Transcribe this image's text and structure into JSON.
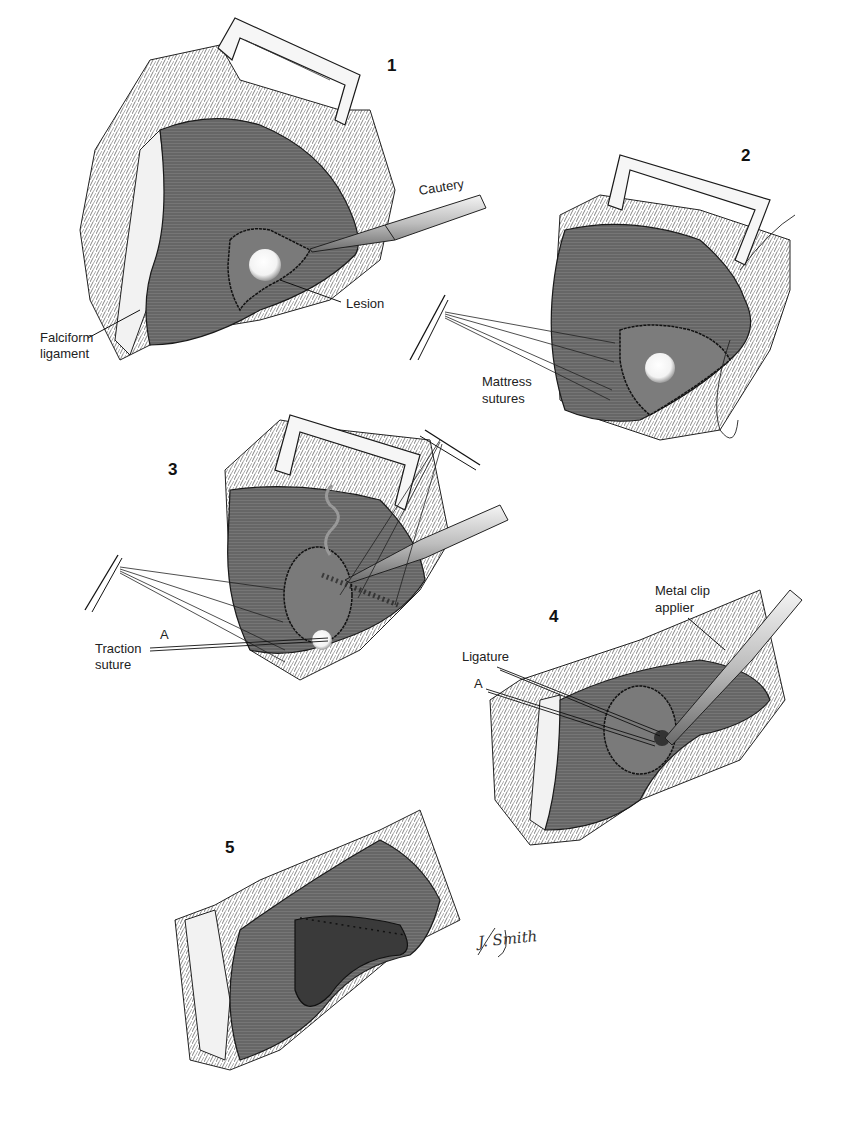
{
  "figure": {
    "panels": [
      {
        "number": "1",
        "labels": [
          "Cautery",
          "Lesion",
          "Falciform\nligament"
        ]
      },
      {
        "number": "2",
        "labels": [
          "Mattress\nsutures"
        ]
      },
      {
        "number": "3",
        "labels": [
          "Traction\nsuture",
          "A"
        ]
      },
      {
        "number": "4",
        "labels": [
          "Metal clip\napplier",
          "Ligature",
          "A"
        ]
      },
      {
        "number": "5",
        "labels": []
      }
    ],
    "signature": "J. Smith",
    "colors": {
      "tissue": "#6e6e6e",
      "tissue_dark": "#4a4a4a",
      "lines": "#1a1a1a",
      "instrument": "#cfcfcf",
      "lesion": "#ffffff",
      "background": "#ffffff"
    }
  },
  "labels": {
    "p1_num": "1",
    "p2_num": "2",
    "p3_num": "3",
    "p4_num": "4",
    "p5_num": "5",
    "cautery": "Cautery",
    "lesion": "Lesion",
    "falciform_1": "Falciform",
    "falciform_2": "ligament",
    "mattress_1": "Mattress",
    "mattress_2": "sutures",
    "traction_1": "Traction",
    "traction_2": "suture",
    "a3": "A",
    "clip_1": "Metal clip",
    "clip_2": "applier",
    "ligature": "Ligature",
    "a4": "A",
    "signature": "J. Smith"
  }
}
